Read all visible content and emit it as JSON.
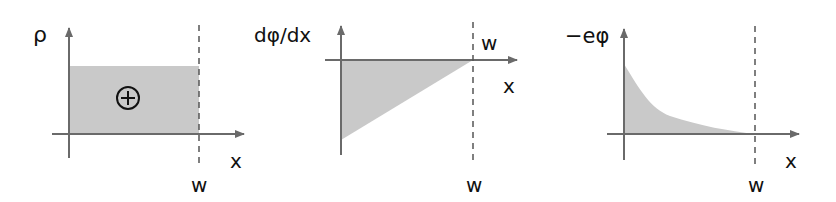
{
  "figure": {
    "colors": {
      "shade": "#c9c9c9",
      "axis": "#6a6a6a",
      "text": "#111111"
    },
    "panels": [
      {
        "id": "charge-density",
        "y_label": "ρ",
        "x_label": "x",
        "boundary_label": "w",
        "region_symbol": "⊕",
        "shape": "rectangle",
        "description": "Uniform positive charge density from 0 to w"
      },
      {
        "id": "field",
        "y_label": "dφ/dx",
        "x_label": "x",
        "boundary_label_top": "w",
        "boundary_label_bottom": "w",
        "shape": "triangle",
        "description": "Linearly increasing (negative) potential gradient reaching zero at w"
      },
      {
        "id": "potential-energy",
        "y_label": "−eφ",
        "x_label": "x",
        "boundary_label": "w",
        "shape": "decaying-curve",
        "description": "Potential energy decays from maximum at x=0 to zero at w"
      }
    ]
  }
}
